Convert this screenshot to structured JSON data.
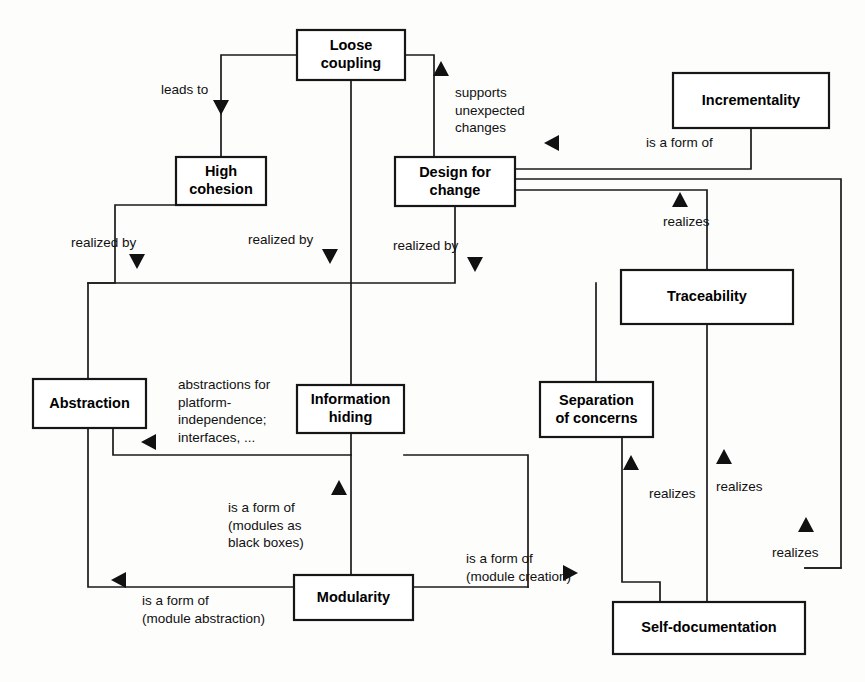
{
  "diagram": {
    "type": "concept-relationship-diagram",
    "background_color": "#fdfdfc",
    "line_color": "#1a1a1a",
    "box_fill": "#ffffff",
    "box_stroke": "#161616",
    "text_color": "#000000",
    "nodes": [
      {
        "id": "loose-coupling",
        "label_line1": "Loose",
        "label_line2": "coupling",
        "x": 297,
        "y": 30,
        "w": 108,
        "h": 50
      },
      {
        "id": "high-cohesion",
        "label_line1": "High",
        "label_line2": "cohesion",
        "x": 176,
        "y": 157,
        "w": 90,
        "h": 48
      },
      {
        "id": "design-for-change",
        "label_line1": "Design for",
        "label_line2": "change",
        "x": 395,
        "y": 157,
        "w": 120,
        "h": 49
      },
      {
        "id": "incrementality",
        "label_line1": "Incrementality",
        "label_line2": "",
        "x": 673,
        "y": 73,
        "w": 156,
        "h": 55
      },
      {
        "id": "traceability",
        "label_line1": "Traceability",
        "label_line2": "",
        "x": 621,
        "y": 270,
        "w": 172,
        "h": 54
      },
      {
        "id": "abstraction",
        "label_line1": "Abstraction",
        "label_line2": "",
        "x": 33,
        "y": 379,
        "w": 113,
        "h": 49
      },
      {
        "id": "information-hiding",
        "label_line1": "Information",
        "label_line2": "hiding",
        "x": 297,
        "y": 385,
        "w": 107,
        "h": 48
      },
      {
        "id": "separation-of-concerns",
        "label_line1": "Separation",
        "label_line2": "of concerns",
        "x": 540,
        "y": 382,
        "w": 113,
        "h": 55
      },
      {
        "id": "modularity",
        "label_line1": "Modularity",
        "label_line2": "",
        "x": 294,
        "y": 575,
        "w": 119,
        "h": 45
      },
      {
        "id": "self-documentation",
        "label_line1": "Self-documentation",
        "label_line2": "",
        "x": 613,
        "y": 602,
        "w": 192,
        "h": 52
      }
    ],
    "edges": [
      {
        "id": "loose-coupling-to-high-cohesion",
        "label": "leads to",
        "label_x": 161,
        "label_y": 90,
        "label_anchor": "start",
        "path": "M 297,55 L 221,55 L 221,157",
        "arrow": {
          "x": 221,
          "y": 108,
          "dir": "down"
        }
      },
      {
        "id": "design-for-change-supports-loose-coupling",
        "label_lines": [
          "supports",
          "unexpected",
          "changes"
        ],
        "label_x": 455,
        "label_y": 93,
        "label_anchor": "start",
        "path": "M 405,55 L 434,55 L 434,157",
        "arrow": {
          "x": 441,
          "y": 68,
          "dir": "up"
        }
      },
      {
        "id": "incrementality-is-a-form-of-design-for-change",
        "label": "is a form of",
        "label_x": 646,
        "label_y": 143,
        "label_anchor": "start",
        "path": "M 751,128 L 751,169 L 515,169",
        "arrow": {
          "x": 551,
          "y": 143,
          "dir": "left"
        }
      },
      {
        "id": "high-cohesion-realized-by-abstraction",
        "label": "realized by",
        "label_x": 71,
        "label_y": 243,
        "label_anchor": "start",
        "path": "M 176,205 L 115,205 L 115,283 L 88,283 L 88,379",
        "arrow": {
          "x": 137,
          "y": 262,
          "dir": "down"
        }
      },
      {
        "id": "loose-coupling-realized-by-information-hiding",
        "label": "realized by",
        "label_x": 248,
        "label_y": 240,
        "label_anchor": "start",
        "path": "M 351,80 L 351,385",
        "arrow": {
          "x": 330,
          "y": 257,
          "dir": "down"
        }
      },
      {
        "id": "design-for-change-realized-by-separation-of-concerns",
        "label": "realized by",
        "label_x": 393,
        "label_y": 246,
        "label_anchor": "start",
        "path": "M 455,206 L 455,283 L 88,283",
        "arrow": {
          "x": 475,
          "y": 265,
          "dir": "down"
        }
      },
      {
        "id": "design-for-change-spans-right",
        "path": "M 515,179 L 841,179 L 841,568 L 805,568",
        "arrow": null
      },
      {
        "id": "traceability-realizes-design-for-change",
        "label": "realizes",
        "label_x": 663,
        "label_y": 222,
        "label_anchor": "start",
        "path": "M 515,190 L 707,190 L 707,270",
        "arrow": {
          "x": 680,
          "y": 199,
          "dir": "up"
        }
      },
      {
        "id": "separation-of-concerns-top-trunk",
        "path": "M 596,283 L 596,382",
        "arrow": null
      },
      {
        "id": "information-hiding-abstraction-relation",
        "label_lines": [
          "abstractions for",
          "platform-",
          "independence;",
          "interfaces, ..."
        ],
        "label_x": 178,
        "label_y": 385,
        "label_anchor": "start",
        "path": "M 351,433 L 351,455 L 113,455 L 113,428",
        "arrow": {
          "x": 148,
          "y": 442,
          "dir": "left"
        }
      },
      {
        "id": "information-hiding-to-right-trunk",
        "path": "M 404,455 L 528,455 L 528,587",
        "arrow": null
      },
      {
        "id": "modularity-is-a-form-of-information-hiding",
        "label_lines": [
          "is a form of",
          "(modules as",
          "black boxes)"
        ],
        "label_x": 228,
        "label_y": 508,
        "label_anchor": "start",
        "path": "M 351,575 L 351,455",
        "arrow": {
          "x": 339,
          "y": 487,
          "dir": "up"
        }
      },
      {
        "id": "modularity-is-a-form-of-abstraction",
        "label_lines": [
          "is a form of",
          "(module abstraction)"
        ],
        "label_x": 142,
        "label_y": 601,
        "label_anchor": "start",
        "path": "M 294,587 L 88,587 L 88,428",
        "arrow": {
          "x": 118,
          "y": 580,
          "dir": "left"
        }
      },
      {
        "id": "modularity-is-a-form-of-separation-of-concerns",
        "label_lines": [
          "is a form of",
          "(module creation)"
        ],
        "label_x": 466,
        "label_y": 559,
        "label_anchor": "start",
        "path": "M 413,587 L 528,587",
        "arrow": {
          "x": 571,
          "y": 573,
          "dir": "right"
        }
      },
      {
        "id": "self-documentation-realizes-separation-of-concerns",
        "label": "realizes",
        "label_x": 649,
        "label_y": 494,
        "label_anchor": "start",
        "path": "M 622,437 L 622,582 L 660,582 L 660,602",
        "arrow": {
          "x": 631,
          "y": 462,
          "dir": "up"
        }
      },
      {
        "id": "self-documentation-realizes-traceability",
        "label": "realizes",
        "label_x": 716,
        "label_y": 487,
        "label_anchor": "start",
        "path": "M 707,324 L 707,602",
        "arrow": {
          "x": 724,
          "y": 456,
          "dir": "up"
        }
      },
      {
        "id": "self-documentation-realizes-design-for-change",
        "label": "realizes",
        "label_x": 772,
        "label_y": 553,
        "label_anchor": "start",
        "path": "M 805,568 L 841,568",
        "arrow": {
          "x": 806,
          "y": 524,
          "dir": "up"
        }
      }
    ]
  }
}
